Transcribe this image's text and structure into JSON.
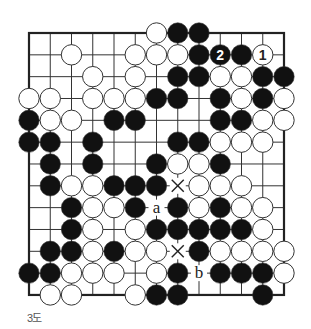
{
  "diagram": {
    "caption": "3도",
    "grid": {
      "cols": 13,
      "rows": 13,
      "x0": 29,
      "y0": 33,
      "dx": 21.25,
      "dy": 21.83
    },
    "edges": [
      "top",
      "left",
      "right",
      "bottom"
    ],
    "line_color": "#333333",
    "stone_colors": {
      "black": "#111111",
      "white": "#ffffff"
    },
    "stones": [
      {
        "c": 6,
        "r": 0,
        "color": "white"
      },
      {
        "c": 7,
        "r": 0,
        "color": "black"
      },
      {
        "c": 8,
        "r": 0,
        "color": "black"
      },
      {
        "c": 2,
        "r": 1,
        "color": "white"
      },
      {
        "c": 5,
        "r": 1,
        "color": "white"
      },
      {
        "c": 6,
        "r": 1,
        "color": "white"
      },
      {
        "c": 7,
        "r": 1,
        "color": "white"
      },
      {
        "c": 8,
        "r": 1,
        "color": "black"
      },
      {
        "c": 9,
        "r": 1,
        "color": "black",
        "label": "2"
      },
      {
        "c": 10,
        "r": 1,
        "color": "black"
      },
      {
        "c": 11,
        "r": 1,
        "color": "white",
        "label": "1"
      },
      {
        "c": 3,
        "r": 2,
        "color": "white"
      },
      {
        "c": 5,
        "r": 2,
        "color": "white"
      },
      {
        "c": 7,
        "r": 2,
        "color": "black"
      },
      {
        "c": 8,
        "r": 2,
        "color": "black"
      },
      {
        "c": 9,
        "r": 2,
        "color": "white"
      },
      {
        "c": 10,
        "r": 2,
        "color": "white"
      },
      {
        "c": 11,
        "r": 2,
        "color": "black"
      },
      {
        "c": 12,
        "r": 2,
        "color": "black"
      },
      {
        "c": 0,
        "r": 3,
        "color": "white"
      },
      {
        "c": 1,
        "r": 3,
        "color": "white"
      },
      {
        "c": 3,
        "r": 3,
        "color": "white"
      },
      {
        "c": 4,
        "r": 3,
        "color": "white"
      },
      {
        "c": 5,
        "r": 3,
        "color": "white"
      },
      {
        "c": 6,
        "r": 3,
        "color": "black"
      },
      {
        "c": 7,
        "r": 3,
        "color": "black"
      },
      {
        "c": 9,
        "r": 3,
        "color": "black"
      },
      {
        "c": 10,
        "r": 3,
        "color": "white"
      },
      {
        "c": 11,
        "r": 3,
        "color": "black"
      },
      {
        "c": 12,
        "r": 3,
        "color": "white"
      },
      {
        "c": 0,
        "r": 4,
        "color": "black"
      },
      {
        "c": 1,
        "r": 4,
        "color": "white"
      },
      {
        "c": 2,
        "r": 4,
        "color": "white"
      },
      {
        "c": 4,
        "r": 4,
        "color": "black"
      },
      {
        "c": 5,
        "r": 4,
        "color": "black"
      },
      {
        "c": 9,
        "r": 4,
        "color": "black"
      },
      {
        "c": 10,
        "r": 4,
        "color": "black"
      },
      {
        "c": 11,
        "r": 4,
        "color": "white"
      },
      {
        "c": 12,
        "r": 4,
        "color": "white"
      },
      {
        "c": 0,
        "r": 5,
        "color": "black"
      },
      {
        "c": 1,
        "r": 5,
        "color": "black"
      },
      {
        "c": 3,
        "r": 5,
        "color": "black"
      },
      {
        "c": 7,
        "r": 5,
        "color": "black"
      },
      {
        "c": 8,
        "r": 5,
        "color": "black"
      },
      {
        "c": 9,
        "r": 5,
        "color": "white"
      },
      {
        "c": 10,
        "r": 5,
        "color": "white"
      },
      {
        "c": 11,
        "r": 5,
        "color": "white"
      },
      {
        "c": 1,
        "r": 6,
        "color": "black"
      },
      {
        "c": 3,
        "r": 6,
        "color": "black"
      },
      {
        "c": 6,
        "r": 6,
        "color": "black"
      },
      {
        "c": 7,
        "r": 6,
        "color": "white"
      },
      {
        "c": 8,
        "r": 6,
        "color": "white"
      },
      {
        "c": 9,
        "r": 6,
        "color": "black"
      },
      {
        "c": 1,
        "r": 7,
        "color": "black"
      },
      {
        "c": 2,
        "r": 7,
        "color": "white"
      },
      {
        "c": 3,
        "r": 7,
        "color": "white"
      },
      {
        "c": 4,
        "r": 7,
        "color": "black"
      },
      {
        "c": 5,
        "r": 7,
        "color": "black"
      },
      {
        "c": 6,
        "r": 7,
        "color": "black"
      },
      {
        "c": 8,
        "r": 7,
        "color": "white"
      },
      {
        "c": 9,
        "r": 7,
        "color": "white"
      },
      {
        "c": 10,
        "r": 7,
        "color": "white"
      },
      {
        "c": 2,
        "r": 8,
        "color": "black"
      },
      {
        "c": 3,
        "r": 8,
        "color": "white"
      },
      {
        "c": 4,
        "r": 8,
        "color": "white"
      },
      {
        "c": 5,
        "r": 8,
        "color": "black"
      },
      {
        "c": 7,
        "r": 8,
        "color": "black"
      },
      {
        "c": 8,
        "r": 8,
        "color": "white"
      },
      {
        "c": 9,
        "r": 8,
        "color": "black"
      },
      {
        "c": 10,
        "r": 8,
        "color": "white"
      },
      {
        "c": 11,
        "r": 8,
        "color": "white"
      },
      {
        "c": 2,
        "r": 9,
        "color": "black"
      },
      {
        "c": 3,
        "r": 9,
        "color": "white"
      },
      {
        "c": 5,
        "r": 9,
        "color": "white"
      },
      {
        "c": 6,
        "r": 9,
        "color": "black"
      },
      {
        "c": 7,
        "r": 9,
        "color": "black"
      },
      {
        "c": 8,
        "r": 9,
        "color": "black"
      },
      {
        "c": 9,
        "r": 9,
        "color": "black"
      },
      {
        "c": 10,
        "r": 9,
        "color": "black"
      },
      {
        "c": 11,
        "r": 9,
        "color": "white"
      },
      {
        "c": 1,
        "r": 10,
        "color": "black"
      },
      {
        "c": 2,
        "r": 10,
        "color": "black"
      },
      {
        "c": 3,
        "r": 10,
        "color": "white"
      },
      {
        "c": 4,
        "r": 10,
        "color": "black"
      },
      {
        "c": 5,
        "r": 10,
        "color": "white"
      },
      {
        "c": 6,
        "r": 10,
        "color": "white"
      },
      {
        "c": 8,
        "r": 10,
        "color": "black"
      },
      {
        "c": 9,
        "r": 10,
        "color": "white"
      },
      {
        "c": 10,
        "r": 10,
        "color": "white"
      },
      {
        "c": 11,
        "r": 10,
        "color": "white"
      },
      {
        "c": 12,
        "r": 10,
        "color": "white"
      },
      {
        "c": 0,
        "r": 11,
        "color": "black"
      },
      {
        "c": 1,
        "r": 11,
        "color": "black"
      },
      {
        "c": 2,
        "r": 11,
        "color": "white"
      },
      {
        "c": 3,
        "r": 11,
        "color": "white"
      },
      {
        "c": 4,
        "r": 11,
        "color": "white"
      },
      {
        "c": 6,
        "r": 11,
        "color": "white"
      },
      {
        "c": 7,
        "r": 11,
        "color": "black"
      },
      {
        "c": 9,
        "r": 11,
        "color": "black"
      },
      {
        "c": 10,
        "r": 11,
        "color": "black"
      },
      {
        "c": 11,
        "r": 11,
        "color": "black"
      },
      {
        "c": 12,
        "r": 11,
        "color": "white"
      },
      {
        "c": 1,
        "r": 12,
        "color": "white"
      },
      {
        "c": 2,
        "r": 12,
        "color": "white"
      },
      {
        "c": 5,
        "r": 12,
        "color": "white"
      },
      {
        "c": 6,
        "r": 12,
        "color": "black"
      },
      {
        "c": 7,
        "r": 12,
        "color": "black"
      },
      {
        "c": 11,
        "r": 12,
        "color": "black"
      }
    ],
    "marks": [
      {
        "c": 7,
        "r": 7,
        "type": "cross",
        "text": "×"
      },
      {
        "c": 7,
        "r": 10,
        "type": "cross",
        "text": "×"
      },
      {
        "c": 6,
        "r": 8,
        "type": "letter",
        "text": "a"
      },
      {
        "c": 8,
        "r": 11,
        "type": "letter",
        "text": "b"
      }
    ]
  }
}
